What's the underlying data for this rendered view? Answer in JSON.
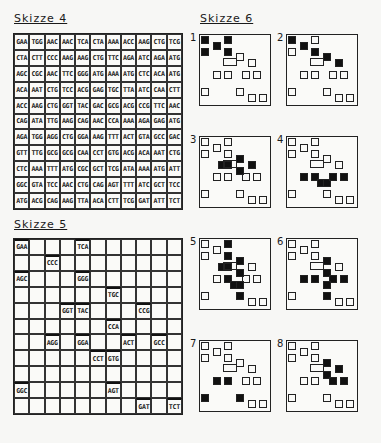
{
  "skizze4": {
    "title": "Skizze 4",
    "rows": [
      [
        "GAA",
        "TGG",
        "AAC",
        "AAC",
        "TCA",
        "CTA",
        "AAA",
        "ACC",
        "AAG",
        "CTG",
        "TCG"
      ],
      [
        "CTA",
        "CTT",
        "CCC",
        "AAG",
        "AAG",
        "CTG",
        "TTC",
        "AGA",
        "ATC",
        "AGA",
        "ATG"
      ],
      [
        "AGC",
        "CGC",
        "AAC",
        "TTC",
        "GGG",
        "ATG",
        "AAA",
        "ATG",
        "CTC",
        "ACA",
        "ATG"
      ],
      [
        "ACA",
        "AAT",
        "CTG",
        "TCC",
        "ACG",
        "GAG",
        "TGC",
        "TTA",
        "ATC",
        "CAA",
        "CTT"
      ],
      [
        "ACC",
        "AAG",
        "CTG",
        "GGT",
        "TAC",
        "GAC",
        "GCG",
        "ACG",
        "CCG",
        "TTC",
        "AAC"
      ],
      [
        "CAG",
        "ATA",
        "TTG",
        "AAG",
        "CAG",
        "AAC",
        "CCA",
        "AAA",
        "AGA",
        "GAG",
        "ATG"
      ],
      [
        "AGA",
        "TGG",
        "AGG",
        "CTG",
        "GGA",
        "AAG",
        "TTT",
        "ACT",
        "GTA",
        "GCC",
        "GAC"
      ],
      [
        "GTT",
        "TTG",
        "GCG",
        "GCG",
        "CAA",
        "CCT",
        "GTG",
        "ACG",
        "ACA",
        "AAT",
        "CTG"
      ],
      [
        "CTC",
        "AAA",
        "TTT",
        "ATG",
        "CGC",
        "GCT",
        "TCG",
        "ATA",
        "AAA",
        "ATG",
        "ATT"
      ],
      [
        "GGC",
        "GTA",
        "TCC",
        "AAC",
        "CTG",
        "CAG",
        "AGT",
        "TTT",
        "ATC",
        "GCT",
        "TCC"
      ],
      [
        "ATG",
        "ACG",
        "CAG",
        "AAG",
        "TTA",
        "ACA",
        "CTT",
        "TCG",
        "GAT",
        "ATT",
        "TCT"
      ]
    ]
  },
  "skizze5": {
    "title": "Skizze 5",
    "rows": [
      [
        "GAA",
        "",
        "",
        "",
        "TCA",
        "",
        "",
        "",
        "",
        "",
        ""
      ],
      [
        "",
        "",
        "CCC",
        "",
        "",
        "",
        "",
        "",
        "",
        "",
        ""
      ],
      [
        "AGC",
        "",
        "",
        "",
        "GGG",
        "",
        "",
        "",
        "",
        "",
        ""
      ],
      [
        "",
        "",
        "",
        "",
        "",
        "",
        "TGC",
        "",
        "",
        "",
        ""
      ],
      [
        "",
        "",
        "",
        "GGT",
        "TAC",
        "",
        "",
        "",
        "CCG",
        "",
        ""
      ],
      [
        "",
        "",
        "",
        "",
        "",
        "",
        "CCA",
        "",
        "",
        "",
        ""
      ],
      [
        "",
        "",
        "AGG",
        "",
        "GGA",
        "",
        "",
        "ACT",
        "",
        "GCC",
        ""
      ],
      [
        "",
        "",
        "",
        "",
        "",
        "CCT",
        "GTG",
        "",
        "",
        "",
        ""
      ],
      [
        "",
        "",
        "",
        "",
        "",
        "",
        "",
        "",
        "",
        "",
        ""
      ],
      [
        "GGC",
        "",
        "",
        "",
        "",
        "",
        "AGT",
        "",
        "",
        "",
        ""
      ],
      [
        "",
        "",
        "",
        "",
        "",
        "",
        "",
        "",
        "GAT",
        "",
        "TCT"
      ]
    ]
  },
  "skizze6": {
    "title": "Skizze 6",
    "panels": [
      {
        "label": "1",
        "filled": [
          [
            0,
            0
          ],
          [
            0,
            4
          ],
          [
            1,
            2
          ],
          [
            2,
            0
          ],
          [
            2,
            4
          ]
        ]
      },
      {
        "label": "2",
        "filled": [
          [
            0,
            0
          ],
          [
            1,
            2
          ],
          [
            2,
            4
          ],
          [
            3,
            6
          ],
          [
            4,
            8
          ]
        ]
      },
      {
        "label": "3",
        "filled": [
          [
            3,
            6
          ],
          [
            4,
            3
          ],
          [
            4,
            4
          ],
          [
            4,
            8
          ],
          [
            5,
            6
          ]
        ]
      },
      {
        "label": "4",
        "filled": [
          [
            6,
            2
          ],
          [
            6,
            4
          ],
          [
            7,
            5
          ],
          [
            7,
            6
          ],
          [
            6,
            7
          ],
          [
            6,
            9
          ]
        ]
      },
      {
        "label": "5",
        "filled": [
          [
            0,
            4
          ],
          [
            2,
            4
          ],
          [
            3,
            6
          ],
          [
            4,
            3
          ],
          [
            4,
            4
          ],
          [
            5,
            6
          ],
          [
            6,
            4
          ],
          [
            7,
            5
          ],
          [
            7,
            6
          ],
          [
            9,
            6
          ]
        ]
      },
      {
        "label": "6",
        "filled": [
          [
            3,
            6
          ],
          [
            5,
            6
          ],
          [
            6,
            2
          ],
          [
            6,
            4
          ],
          [
            6,
            7
          ],
          [
            6,
            9
          ],
          [
            7,
            6
          ],
          [
            9,
            6
          ]
        ]
      },
      {
        "label": "7",
        "filled": [
          [
            6,
            2
          ],
          [
            6,
            4
          ],
          [
            9,
            0
          ],
          [
            9,
            6
          ]
        ]
      },
      {
        "label": "8",
        "filled": [
          [
            3,
            6
          ],
          [
            4,
            8
          ],
          [
            5,
            6
          ],
          [
            6,
            7
          ],
          [
            6,
            9
          ]
        ]
      }
    ],
    "outline_cells": [
      [
        0,
        0
      ],
      [
        0,
        4
      ],
      [
        1,
        2
      ],
      [
        2,
        0
      ],
      [
        2,
        4
      ],
      [
        3,
        6
      ],
      [
        4,
        8
      ],
      [
        6,
        2
      ],
      [
        6,
        4
      ],
      [
        6,
        7
      ],
      [
        6,
        9
      ],
      [
        9,
        0
      ],
      [
        9,
        6
      ],
      [
        10,
        8
      ],
      [
        10,
        10
      ]
    ]
  }
}
